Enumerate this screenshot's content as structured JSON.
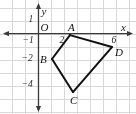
{
  "figure": {
    "type": "coordinate-plane-polygon",
    "background_color": "#ffffff",
    "grid_color": "#d8d8d8",
    "axis_color": "#3a3a3a",
    "polygon_color": "#111111"
  },
  "axes": {
    "x_axis_label": "x",
    "y_axis_label": "y",
    "origin_label": "O",
    "x_ticks": [
      {
        "label": "2",
        "value": 2
      },
      {
        "label": "6",
        "value": 6
      }
    ],
    "y_ticks": [
      {
        "label": "1",
        "value": 1
      },
      {
        "label": "−1",
        "value": -1
      },
      {
        "label": "−2",
        "value": -2
      },
      {
        "label": "−4",
        "value": -4
      }
    ],
    "x_range": [
      -2.96,
      7.5
    ],
    "y_range": [
      -6.19,
      2.58
    ],
    "grid_spacing": 1
  },
  "chart_data": {
    "type": "scatter",
    "title": "",
    "xlabel": "x",
    "ylabel": "y",
    "xlim": [
      -2.96,
      7.5
    ],
    "ylim": [
      -6.19,
      2.58
    ],
    "grid": true,
    "legend": "none",
    "vertices": [
      {
        "name": "A",
        "x": 2.42,
        "y": -0.12,
        "label_dx": -2,
        "label_dy": -13
      },
      {
        "name": "B",
        "x": 1.04,
        "y": -1.96,
        "label_dx": -12,
        "label_dy": -5
      },
      {
        "name": "C",
        "x": 2.65,
        "y": -4.5,
        "label_dx": -3,
        "label_dy": 3
      },
      {
        "name": "D",
        "x": 5.65,
        "y": -1.04,
        "label_dx": 3,
        "label_dy": 0
      }
    ],
    "edges": [
      {
        "from": "A",
        "to": "B"
      },
      {
        "from": "B",
        "to": "C"
      },
      {
        "from": "C",
        "to": "D"
      },
      {
        "from": "D",
        "to": "A"
      }
    ]
  }
}
